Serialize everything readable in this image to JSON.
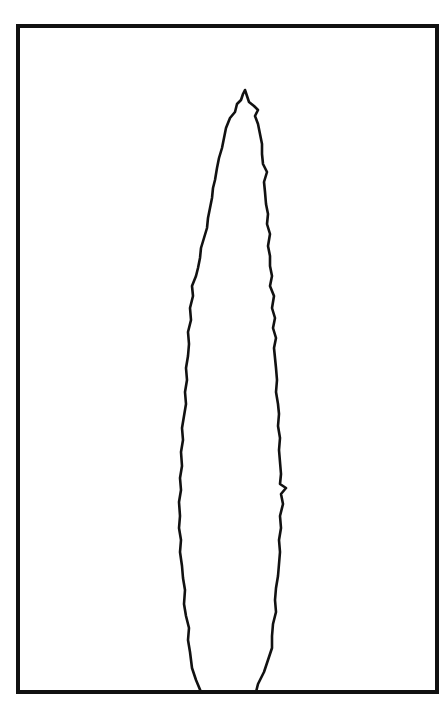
{
  "figure": {
    "colors": {
      "background": "#ffffff",
      "stroke": "#111111"
    },
    "frame": {
      "x": 18,
      "y": 26,
      "width": 419,
      "height": 666,
      "stroke_width": 4
    },
    "tree": {
      "tip": [
        245,
        92
      ],
      "base_left": [
        201,
        692
      ],
      "base_right": [
        256,
        692
      ],
      "stroke_width": 2.6
    }
  }
}
